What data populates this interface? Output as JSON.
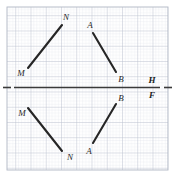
{
  "figure": {
    "width": 175,
    "height": 176,
    "background_color": "#ffffff"
  },
  "grid": {
    "name": "graph-paper-grid",
    "minor_spacing": 3.05,
    "major_spacing": 15.25,
    "minor_color": "#d8dce6",
    "major_color": "#b9bfcd",
    "border_color": "#b0b6c4",
    "left": 7,
    "top": 7,
    "right": 168,
    "bottom": 170
  },
  "axis": {
    "name": "mirror-line-HF",
    "y": 87.5,
    "x_start": 3,
    "x_end": 172,
    "color": "#3a3a3a",
    "stroke_width": 1.6,
    "dash_left": {
      "x1": 3,
      "x2": 11
    },
    "solid": {
      "x1": 14,
      "x2": 160
    },
    "dash_right": {
      "x1": 164,
      "x2": 172
    },
    "labels": [
      {
        "text": "H",
        "x": 152,
        "y": 80
      },
      {
        "text": "F",
        "x": 152,
        "y": 95
      }
    ]
  },
  "segments": [
    {
      "name": "segment-MN-above",
      "label": "MN",
      "color": "#262626",
      "stroke_width": 2.1,
      "x1": 28,
      "y1": 68,
      "x2": 62,
      "y2": 25
    },
    {
      "name": "segment-AB-above",
      "label": "AB",
      "color": "#262626",
      "stroke_width": 2.1,
      "x1": 93,
      "y1": 33,
      "x2": 116,
      "y2": 72
    },
    {
      "name": "segment-MN-below",
      "label": "MN",
      "color": "#262626",
      "stroke_width": 2.1,
      "x1": 28,
      "y1": 108,
      "x2": 62,
      "y2": 151
    },
    {
      "name": "segment-AB-below",
      "label": "AB",
      "color": "#262626",
      "stroke_width": 2.1,
      "x1": 93,
      "y1": 143,
      "x2": 116,
      "y2": 104
    }
  ],
  "point_labels": [
    {
      "name": "label-N-above",
      "text": "N",
      "x": 66,
      "y": 17
    },
    {
      "name": "label-A-above",
      "text": "A",
      "x": 90,
      "y": 25
    },
    {
      "name": "label-M-above",
      "text": "M",
      "x": 21,
      "y": 73
    },
    {
      "name": "label-B-above",
      "text": "B",
      "x": 121,
      "y": 79
    },
    {
      "name": "label-M-below",
      "text": "M",
      "x": 22,
      "y": 113
    },
    {
      "name": "label-B-below",
      "text": "B",
      "x": 121,
      "y": 98
    },
    {
      "name": "label-N-below",
      "text": "N",
      "x": 70,
      "y": 157
    },
    {
      "name": "label-A-below",
      "text": "A",
      "x": 89,
      "y": 151
    }
  ]
}
